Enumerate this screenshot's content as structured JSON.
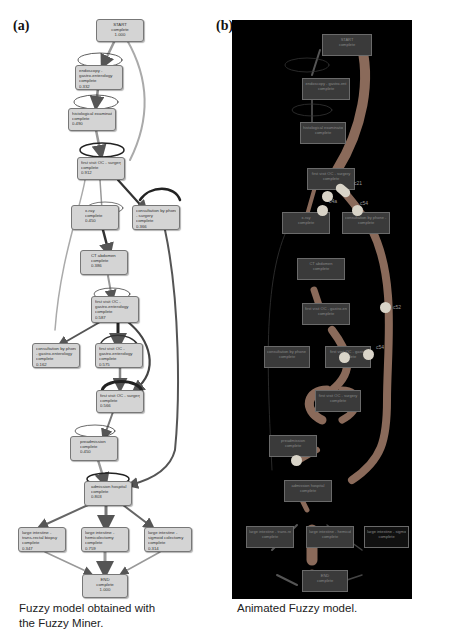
{
  "panel_a": {
    "label": "(a)",
    "caption_line1": "Fuzzy model obtained with",
    "caption_line2": "the Fuzzy Miner.",
    "nodes": [
      {
        "l1": "START",
        "l2": "complete",
        "l3": "1.000"
      },
      {
        "l1": "endoscopy -",
        "l2": "gastro-enterology",
        "l3": "complete",
        "l4": "0.332"
      },
      {
        "l1": "histological examination",
        "l2": "complete",
        "l3": "0.490"
      },
      {
        "l1": "first visit OC - surgery",
        "l2": "complete",
        "l3": "0.912"
      },
      {
        "l1": "x-ray",
        "l2": "complete",
        "l3": "0.450"
      },
      {
        "l1": "consultation by phone",
        "l2": "- surgery",
        "l3": "complete",
        "l4": "0.366"
      },
      {
        "l1": "CT abdomen",
        "l2": "complete",
        "l3": "0.386"
      },
      {
        "l1": "first visit OC -",
        "l2": "gastro-enterology",
        "l3": "complete",
        "l4": "0.587"
      },
      {
        "l1": "consultation by phone",
        "l2": "- gastro-enterology",
        "l3": "complete",
        "l4": "0.162"
      },
      {
        "l1": "first visit OC -",
        "l2": "gastro-enterology",
        "l3": "complete",
        "l4": "0.575"
      },
      {
        "l1": "first visit OC - surgery",
        "l2": "complete",
        "l3": "0.566"
      },
      {
        "l1": "preadmission",
        "l2": "complete",
        "l3": "0.450"
      },
      {
        "l1": "admission hospital",
        "l2": "complete",
        "l3": "0.803"
      },
      {
        "l1": "large intestine -",
        "l2": "trans-rectal biopsy",
        "l3": "complete",
        "l4": "0.347"
      },
      {
        "l1": "large intestine -",
        "l2": "hemicolectomy",
        "l3": "complete",
        "l4": "0.759"
      },
      {
        "l1": "large intestine -",
        "l2": "sigmoid colectomy",
        "l3": "complete",
        "l4": "0.314"
      },
      {
        "l1": "END",
        "l2": "complete",
        "l3": "1.000"
      }
    ]
  },
  "panel_b": {
    "label": "(b)",
    "caption": "Animated Fuzzy model.",
    "background": "#000000",
    "token_color": "#d9d4c8",
    "flow_color": "#8a6a5a",
    "token_labels": [
      "c21",
      "c4a",
      "c54",
      "c52",
      "c54"
    ],
    "nodes": [
      {
        "l1": "START",
        "l2": "complete"
      },
      {
        "l1": "endoscopy - gastro-ent",
        "l2": "complete"
      },
      {
        "l1": "histological examination",
        "l2": "complete"
      },
      {
        "l1": "first visit OC - surgery",
        "l2": "complete"
      },
      {
        "l1": "x-ray",
        "l2": "complete"
      },
      {
        "l1": "consultation by phone - surgery",
        "l2": "complete"
      },
      {
        "l1": "CT abdomen",
        "l2": "complete"
      },
      {
        "l1": "first visit OC - gastro-ent",
        "l2": "complete"
      },
      {
        "l1": "consultation by phone - gastro",
        "l2": "complete"
      },
      {
        "l1": "first visit OC - gastro",
        "l2": "complete"
      },
      {
        "l1": "first visit OC - surgery",
        "l2": "complete"
      },
      {
        "l1": "preadmission",
        "l2": "complete"
      },
      {
        "l1": "admission hospital",
        "l2": "complete"
      },
      {
        "l1": "large intestine - trans-rectal",
        "l2": "complete"
      },
      {
        "l1": "large intestine - hemicolectomy",
        "l2": "complete"
      },
      {
        "l1": "large intestine - sigmoid colectomy",
        "l2": "complete"
      },
      {
        "l1": "END",
        "l2": "complete"
      }
    ]
  }
}
